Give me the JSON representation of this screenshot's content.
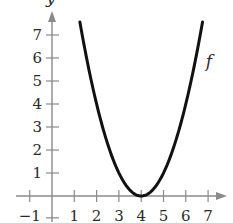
{
  "chart_data": {
    "type": "line",
    "title": "",
    "xlabel": "",
    "ylabel": "y",
    "function": "f(x) = (x - 4)^2",
    "series": [
      {
        "name": "f",
        "x": [
          1.25,
          1.5,
          2,
          2.5,
          3,
          3.5,
          4,
          4.5,
          5,
          5.5,
          6,
          6.5,
          6.75
        ],
        "values": [
          7.5625,
          6.25,
          4,
          2.25,
          1,
          0.25,
          0,
          0.25,
          1,
          2.25,
          4,
          6.25,
          7.5625
        ]
      }
    ],
    "vertex": [
      4,
      0
    ],
    "xlim": [
      -1.2,
      7.8
    ],
    "ylim": [
      -0.5,
      8
    ],
    "x_ticks": [
      -1,
      1,
      2,
      3,
      4,
      5,
      6,
      7
    ],
    "y_ticks": [
      1,
      2,
      3,
      4,
      5,
      6,
      7
    ],
    "x_tick_labels": [
      "−1",
      "1",
      "2",
      "3",
      "4",
      "5",
      "6",
      "7"
    ],
    "y_tick_labels": [
      "1",
      "2",
      "3",
      "4",
      "5",
      "6",
      "7"
    ],
    "grid": false,
    "legend": null,
    "annotations": [
      {
        "text": "f",
        "x": 6.9,
        "y": 5.6
      }
    ],
    "colors": {
      "curve": "#111111",
      "axis": "#8a8a8a",
      "text": "#2a2a2a"
    }
  }
}
